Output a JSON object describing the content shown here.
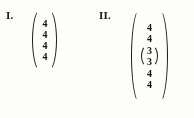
{
  "document": {
    "kind": "scanned-math-fragment",
    "background_color": "#fdfdfc",
    "ink_color": "#16120f"
  },
  "expressions": [
    {
      "label": "I.",
      "label_name": "expression-label-1",
      "bracket": "parenthesis",
      "entries": [
        "4",
        "4",
        "4",
        "4"
      ]
    },
    {
      "label": "II.",
      "label_name": "expression-label-2",
      "bracket": "parenthesis",
      "entries_top": [
        "4",
        "4"
      ],
      "nested": {
        "bracket": "parenthesis",
        "entries": [
          "3",
          "3"
        ]
      },
      "entries_bottom": [
        "4",
        "4"
      ]
    }
  ]
}
